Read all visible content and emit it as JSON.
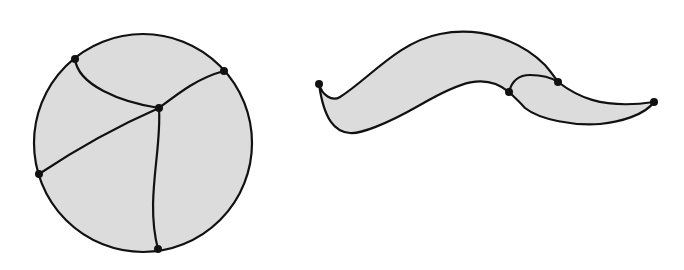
{
  "figure": {
    "colors": {
      "fill": "#dcdcdc",
      "stroke": "#111111",
      "background": "#ffffff"
    },
    "left_shape": {
      "name": "disk",
      "circle": {
        "cx": 143,
        "cy": 143,
        "r": 109
      },
      "vertices": [
        {
          "id": "A",
          "x": 75,
          "y": 59
        },
        {
          "id": "B",
          "x": 224,
          "y": 71
        },
        {
          "id": "C",
          "x": 159,
          "y": 108
        },
        {
          "id": "D",
          "x": 39,
          "y": 174
        },
        {
          "id": "E",
          "x": 158,
          "y": 249
        }
      ],
      "edges": [
        "M75,59 C78,85 120,102 159,108",
        "M159,108 C180,92 198,78 224,71",
        "M159,108 C120,125 75,150 39,174",
        "M159,108 C162,150 145,200 158,249"
      ]
    },
    "right_shape": {
      "name": "wavy-band",
      "outline": "M319,84 C322,95 332,102 340,97 C370,78 398,42 440,34 C480,26 520,40 545,65 C552,73 555,78 558,82 C575,95 600,110 654,102 C645,115 620,122 600,124 C575,126 540,120 525,108 C518,100 513,96 509,92 C485,72 460,82 420,105 C385,125 360,134 350,133 C335,132 324,120 319,84 Z",
      "vertices": [
        {
          "id": "L",
          "x": 319,
          "y": 84
        },
        {
          "id": "P",
          "x": 509,
          "y": 92
        },
        {
          "id": "Q",
          "x": 558,
          "y": 82
        },
        {
          "id": "R",
          "x": 654,
          "y": 102
        }
      ],
      "edges": [
        "M509,92 C512,80 520,75 530,75 C542,75 552,78 558,82"
      ]
    }
  }
}
